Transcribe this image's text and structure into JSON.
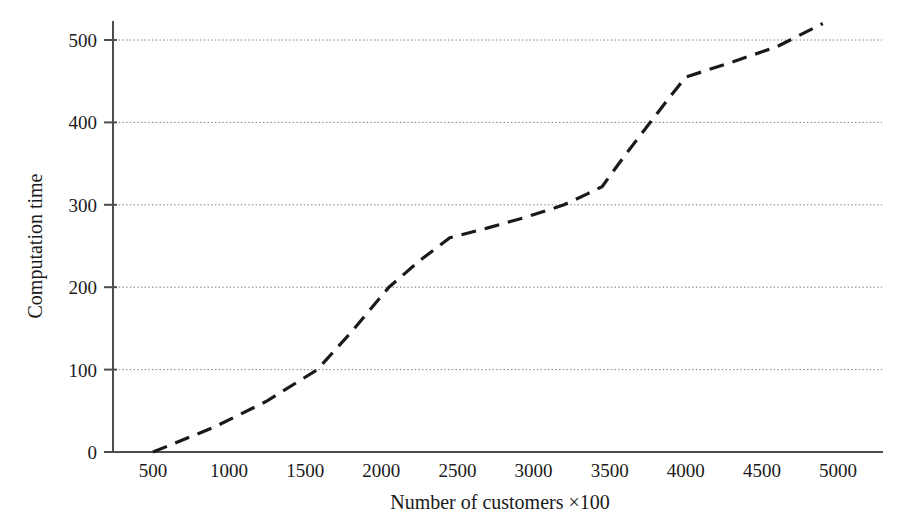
{
  "chart_data": {
    "type": "line",
    "title": "",
    "subtitle": "",
    "xlabel": "Number of customers ×100",
    "ylabel": "Computation time",
    "xlim": [
      250,
      5100
    ],
    "ylim": [
      0,
      540
    ],
    "xticks": [
      500,
      1000,
      1500,
      2000,
      2500,
      3000,
      3500,
      4000,
      4500,
      5000
    ],
    "xtick_labels": [
      "500",
      "1000",
      "1500",
      "2000",
      "2500",
      "3000",
      "3500",
      "4000",
      "4500",
      "5000"
    ],
    "yticks": [
      0,
      100,
      200,
      300,
      400,
      500
    ],
    "ytick_labels": [
      "0",
      "100",
      "200",
      "300",
      "400",
      "500"
    ],
    "grid": {
      "horizontal": true,
      "vertical": false,
      "style": "dotted",
      "color": "#808080"
    },
    "legend": {
      "visible": false,
      "position": "none"
    },
    "series": [
      {
        "name": "Computation time",
        "style": "dashed",
        "color": "#1a1a1a",
        "x": [
          500,
          900,
          1250,
          1580,
          1800,
          2050,
          2250,
          2450,
          2700,
          2950,
          3200,
          3350,
          3450,
          3600,
          3800,
          3900,
          4000,
          4300,
          4600,
          4900
        ],
        "y": [
          0,
          30,
          62,
          100,
          145,
          200,
          232,
          260,
          272,
          285,
          300,
          313,
          322,
          360,
          408,
          432,
          455,
          473,
          492,
          520
        ]
      }
    ],
    "annotations": []
  },
  "axes": {
    "y_axis_name": "y-axis",
    "x_axis_name": "x-axis"
  }
}
